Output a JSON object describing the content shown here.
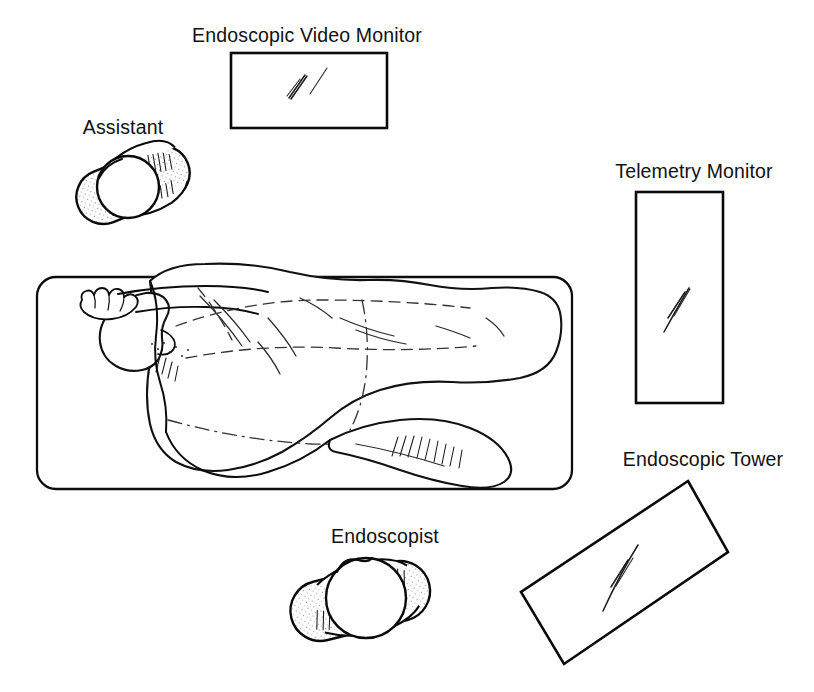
{
  "diagram": {
    "background_color": "#ffffff",
    "ink_color": "#0b0b0b",
    "canvas": {
      "width": 814,
      "height": 692
    }
  },
  "labels": {
    "video_monitor": "Endoscopic Video Monitor",
    "assistant": "Assistant",
    "telemetry_monitor": "Telemetry Monitor",
    "endoscopic_tower": "Endoscopic Tower",
    "endoscopist": "Endoscopist"
  },
  "elements": [
    {
      "key": "video_monitor",
      "label": "Endoscopic Video Monitor",
      "kind": "screen",
      "shape": "rectangle",
      "rotation_deg": 0,
      "bounds": {
        "x": 231,
        "y": 53,
        "width": 156,
        "height": 75
      },
      "label_position": {
        "x": 307,
        "y": 42,
        "anchor": "middle"
      },
      "screen_content": "endoscope-trace"
    },
    {
      "key": "telemetry_monitor",
      "label": "Telemetry Monitor",
      "kind": "screen",
      "shape": "rectangle",
      "rotation_deg": 0,
      "bounds": {
        "x": 636,
        "y": 192,
        "width": 87,
        "height": 211
      },
      "label_position": {
        "x": 694,
        "y": 178,
        "anchor": "middle"
      },
      "screen_content": "endoscope-trace"
    },
    {
      "key": "endoscopic_tower",
      "label": "Endoscopic Tower",
      "kind": "screen",
      "shape": "rectangle",
      "rotation_deg": -29,
      "bounds": {
        "x": 521,
        "y": 481,
        "width": 207,
        "height": 183
      },
      "label_position": {
        "x": 703,
        "y": 466,
        "anchor": "middle"
      },
      "screen_content": "endoscope-trace"
    },
    {
      "key": "assistant",
      "label": "Assistant",
      "kind": "person",
      "shape": "overhead-figure",
      "rotation_deg": -22,
      "bounds": {
        "x": 74,
        "y": 137,
        "width": 118,
        "height": 92
      },
      "label_position": {
        "x": 123,
        "y": 134,
        "anchor": "middle"
      }
    },
    {
      "key": "endoscopist",
      "label": "Endoscopist",
      "kind": "person",
      "shape": "overhead-figure",
      "rotation_deg": -14,
      "bounds": {
        "x": 289,
        "y": 551,
        "width": 142,
        "height": 104
      },
      "label_position": {
        "x": 385,
        "y": 543,
        "anchor": "middle"
      }
    },
    {
      "key": "bed",
      "label": "",
      "kind": "stretcher",
      "shape": "rounded-rectangle",
      "rotation_deg": 0,
      "bounds": {
        "x": 37,
        "y": 277,
        "width": 535,
        "height": 212
      },
      "corner_radius": 19
    },
    {
      "key": "patient",
      "label": "",
      "kind": "patient",
      "shape": "lateral-decubitus-figure",
      "position_note": "left lateral decubitus, head at left, knees flexed",
      "bounds": {
        "x": 62,
        "y": 262,
        "width": 500,
        "height": 222
      }
    }
  ]
}
